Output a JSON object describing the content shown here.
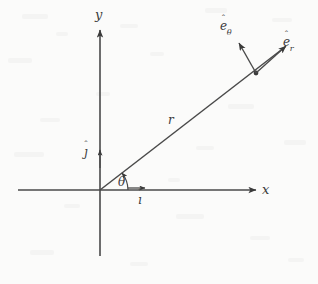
{
  "figure": {
    "background_color": "#fbfbfa",
    "ink_color": "#3a3a3a",
    "width": 318,
    "height": 284
  },
  "axes": {
    "x_label": "x",
    "y_label": "y",
    "origin": {
      "x": 100,
      "y": 190
    },
    "x_axis": {
      "from_x": 18,
      "to_x": 258,
      "y": 190,
      "arrow": "right"
    },
    "y_axis": {
      "x": 100,
      "from_y": 256,
      "to_y": 28,
      "arrow": "up"
    }
  },
  "labels": {
    "radius": "r",
    "angle": "θ",
    "unit_i": "ı",
    "unit_j": "ȷ",
    "unit_e_r_base": "e",
    "unit_e_r_sub": "r",
    "unit_e_theta_base": "e",
    "unit_e_theta_sub": "θ",
    "hat": "ˆ"
  },
  "radial_line": {
    "from": {
      "x": 100,
      "y": 190
    },
    "to": {
      "x": 287,
      "y": 45
    },
    "angle_degrees": 38
  },
  "point_p": {
    "x": 256,
    "y": 73
  },
  "vectors": [
    {
      "name": "e_r",
      "from": {
        "x": 256,
        "y": 73
      },
      "to": {
        "x": 288,
        "y": 45
      }
    },
    {
      "name": "e_theta",
      "from": {
        "x": 256,
        "y": 73
      },
      "to": {
        "x": 237,
        "y": 41
      }
    },
    {
      "name": "i",
      "from": {
        "x": 128,
        "y": 188
      },
      "to": {
        "x": 146,
        "y": 188
      }
    },
    {
      "name": "j",
      "from": {
        "x": 100,
        "y": 168
      },
      "to": {
        "x": 100,
        "y": 149
      }
    }
  ],
  "angle_arc": {
    "center": {
      "x": 100,
      "y": 190
    },
    "radius": 24,
    "start_degrees": 0,
    "end_degrees": 38,
    "arrow": "counterclockwise"
  }
}
